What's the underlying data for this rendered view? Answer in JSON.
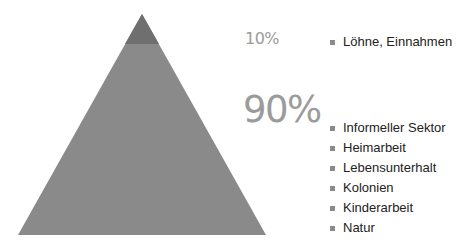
{
  "diagram": {
    "type": "pyramid",
    "colors": {
      "tip": "#6f6f6f",
      "body": "#8a8a8a",
      "percent_text": "#9b9b9b",
      "bullet": "#8a8a8a",
      "label_text": "#222222"
    },
    "tiers": [
      {
        "percent": "10%",
        "position": "top",
        "items": [
          "Löhne, Einnahmen"
        ]
      },
      {
        "percent": "90%",
        "position": "bottom",
        "items": [
          "Informeller Sektor",
          "Heimarbeit",
          "Lebensunterhalt",
          "Kolonien",
          "Kinderarbeit",
          "Natur"
        ]
      }
    ]
  }
}
